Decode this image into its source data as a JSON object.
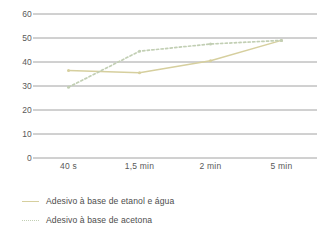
{
  "chart_data": {
    "type": "line",
    "title": "",
    "xlabel": "",
    "ylabel": "",
    "categories": [
      "40 s",
      "1,5 min",
      "2 min",
      "5 min"
    ],
    "ylim": [
      0,
      60
    ],
    "yticks": [
      0,
      10,
      20,
      30,
      40,
      50,
      60
    ],
    "ytick_labels": [
      "0",
      "10",
      "20",
      "30",
      "40",
      "50",
      "60"
    ],
    "grid": true,
    "legend_position": "bottom-left",
    "series": [
      {
        "name": "Adesivo à base de etanol e água",
        "values": [
          36.5,
          35.5,
          40.5,
          49
        ],
        "color": "#d6cf9e",
        "style": "solid",
        "marker": true
      },
      {
        "name": "Adesivo à base de acetona",
        "values": [
          29.5,
          44.5,
          47.5,
          49
        ],
        "color": "#c2cfb4",
        "style": "dotted",
        "marker": true
      }
    ]
  },
  "axis": {
    "ytick_labels": [
      "60",
      "50",
      "40",
      "30",
      "20",
      "10",
      "0"
    ],
    "xtick_labels": [
      "40 s",
      "1,5 min",
      "2 min",
      "5 min"
    ]
  },
  "legend": {
    "items": [
      {
        "label": "Adesivo à base de etanol e água"
      },
      {
        "label": "Adesivo à base de acetona"
      }
    ]
  },
  "colors": {
    "gridline": "#8c8c8c",
    "axis_text": "#595959",
    "series_ethanol": "#d6cf9e",
    "series_acetone": "#c2cfb4",
    "background": "#ffffff"
  }
}
